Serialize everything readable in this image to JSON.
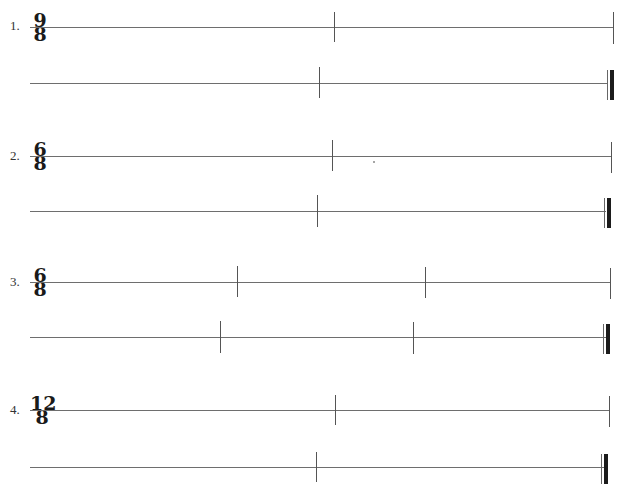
{
  "top_fragment": {
    "left_text": "",
    "center_text": ""
  },
  "exercises": [
    {
      "number": "1.",
      "time_signature": {
        "top": "9",
        "bottom": "8"
      },
      "rows": [
        {
          "line_y": 27,
          "x_start": 78,
          "x_end": 613,
          "barlines": [
            334
          ],
          "bar_top": 12,
          "bar_bottom": 42,
          "final": false
        },
        {
          "line_y": 83,
          "x_start": 30,
          "x_end": 612,
          "barlines": [
            319
          ],
          "bar_top": 67,
          "bar_bottom": 98,
          "final": true
        }
      ]
    },
    {
      "number": "2.",
      "time_signature": {
        "top": "6",
        "bottom": "8"
      },
      "rows": [
        {
          "line_y": 156,
          "x_start": 30,
          "x_end": 611,
          "barlines": [
            332
          ],
          "bar_top": 140,
          "bar_bottom": 171,
          "final": false
        },
        {
          "line_y": 211,
          "x_start": 30,
          "x_end": 610,
          "barlines": [
            317
          ],
          "bar_top": 195,
          "bar_bottom": 227,
          "final": true
        }
      ]
    },
    {
      "number": "3.",
      "time_signature": {
        "top": "6",
        "bottom": "8"
      },
      "rows": [
        {
          "line_y": 282,
          "x_start": 30,
          "x_end": 611,
          "barlines": [
            237,
            425
          ],
          "bar_top": 266,
          "bar_bottom": 297,
          "final": false
        },
        {
          "line_y": 337,
          "x_start": 30,
          "x_end": 610,
          "barlines": [
            220,
            413
          ],
          "bar_top": 321,
          "bar_bottom": 353,
          "final": true
        }
      ]
    },
    {
      "number": "4.",
      "time_signature": {
        "top": "12",
        "bottom": "8"
      },
      "rows": [
        {
          "line_y": 410,
          "x_start": 30,
          "x_end": 610,
          "barlines": [
            335
          ],
          "bar_top": 395,
          "bar_bottom": 425,
          "final": false
        },
        {
          "line_y": 467,
          "x_start": 30,
          "x_end": 608,
          "barlines": [
            316
          ],
          "bar_top": 452,
          "bar_bottom": 482,
          "final": true
        }
      ]
    }
  ],
  "colors": {
    "staff_line": "#6e6e6e",
    "barline": "#555555",
    "final_thick": "#1c1c1c",
    "background": "#ffffff"
  }
}
